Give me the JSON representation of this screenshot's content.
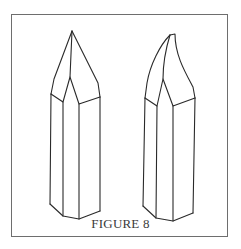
{
  "figure": {
    "caption": "FIGURE 8",
    "stroke_color": "#2a2a2a",
    "frame_color": "#6e6e6e",
    "crystals": [
      {
        "name": "left-crystal",
        "description": "hexagonal prism with symmetric pointed termination"
      },
      {
        "name": "right-crystal",
        "description": "hexagonal prism with curved, hooked termination"
      }
    ]
  }
}
